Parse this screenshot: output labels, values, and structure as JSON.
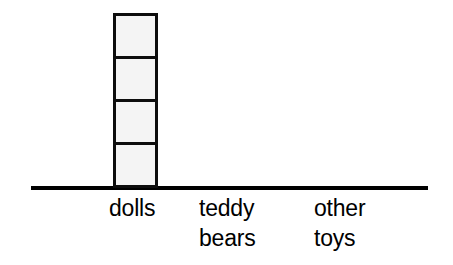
{
  "figure": {
    "background_color": "#ffffff",
    "axis_color": "#000000",
    "cell_fill_color": "#f4f4f4",
    "cell_border_color": "#0d0d0d",
    "text_color": "#000000"
  },
  "categories": [
    {
      "id": "dolls",
      "label": "dolls",
      "count": 4
    },
    {
      "id": "teddy-bears",
      "label": "teddy\nbears",
      "count": 0
    },
    {
      "id": "other-toys",
      "label": "other\ntoys",
      "count": 0
    }
  ],
  "chart_data": {
    "type": "bar",
    "title": "",
    "subtitle": "",
    "xlabel": "",
    "ylabel": "",
    "categories": [
      "dolls",
      "teddy bears",
      "other toys"
    ],
    "values": [
      4,
      0,
      0
    ],
    "unit": "squares",
    "stacked_squares": true,
    "squares_per_column": [
      4,
      0,
      0
    ],
    "ylim": [
      0,
      4
    ],
    "grid": false,
    "legend": false
  }
}
